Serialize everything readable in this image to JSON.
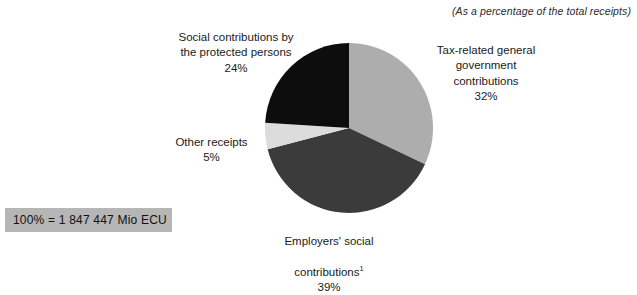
{
  "figure": {
    "note": "(As a percentage of the total receipts)",
    "total_box": "100% = 1 847 447 Mio ECU"
  },
  "labels": {
    "social": {
      "text": "Social contributions by\nthe protected persons",
      "pct": "24%"
    },
    "tax": {
      "text": "Tax-related general\ngovernment\ncontributions",
      "pct": "32%"
    },
    "other": {
      "text": "Other receipts",
      "pct": "5%"
    },
    "employers": {
      "text": "Employers' social",
      "text2": "contributions",
      "footnote_marker": "1",
      "pct": "39%"
    }
  },
  "chart_data": {
    "type": "pie",
    "title": "",
    "subtitle": "(As a percentage of the total receipts)",
    "total_label": "100% = 1 847 447 Mio ECU",
    "total_value": 1847447,
    "total_units": "Mio ECU",
    "unit": "%",
    "start_angle_deg": 0,
    "direction": "clockwise",
    "legend": "none (direct labels)",
    "categories": [
      "Tax-related general government contributions",
      "Employers' social contributions",
      "Other receipts",
      "Social contributions by the protected persons"
    ],
    "values": [
      32,
      39,
      5,
      24
    ],
    "colors": [
      "#ADADAD",
      "#3B3B3B",
      "#DCDCDC",
      "#0D0D0D"
    ],
    "slices": [
      {
        "label": "Tax-related general government contributions",
        "value": 32,
        "color": "#ADADAD"
      },
      {
        "label": "Employers' social contributions",
        "value": 39,
        "color": "#3B3B3B",
        "footnote": "1"
      },
      {
        "label": "Other receipts",
        "value": 5,
        "color": "#DCDCDC"
      },
      {
        "label": "Social contributions by the protected persons",
        "value": 24,
        "color": "#0D0D0D"
      }
    ]
  }
}
